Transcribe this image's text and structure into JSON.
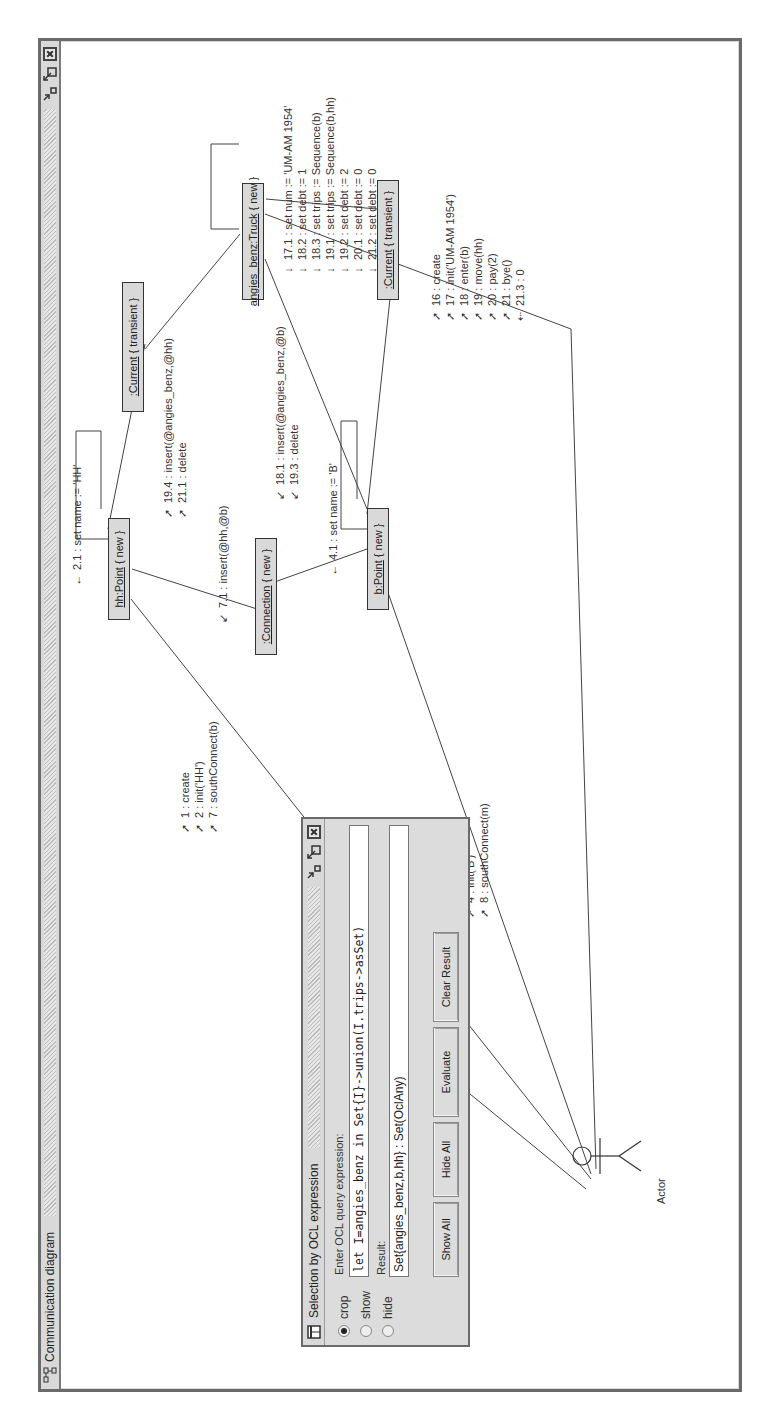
{
  "window": {
    "title": "Communication diagram",
    "controls": [
      "minimize-icon",
      "maximize-icon",
      "close-icon"
    ]
  },
  "diagram": {
    "objects": [
      {
        "id": "hh",
        "name": "hh:Point",
        "state": "{ new }"
      },
      {
        "id": "connection",
        "name": ":Connection",
        "state": "{ new }"
      },
      {
        "id": "b",
        "name": "b:Point",
        "state": "{ new }"
      },
      {
        "id": "current1",
        "name": ":Current",
        "state": "{ transient }"
      },
      {
        "id": "truck",
        "name": "angies_benz:Truck",
        "state": "{ new }"
      },
      {
        "id": "current2",
        "name": ":Current",
        "state": "{ transient }"
      }
    ],
    "actor": {
      "label": "Actor"
    },
    "messages": {
      "actor_hh": [
        "1 : create",
        "2 : init('HH')",
        "7 : southConnect(b)"
      ],
      "actor_b": [
        "3 : create",
        "4 : init('B')",
        "8 : southConnect(m)"
      ],
      "actor_truck": [
        "16 : create",
        "17 : init('UM-AM 1954')",
        "18 : enter(b)",
        "19 : move(hh)",
        "20 : pay(2)",
        "21 : bye()",
        "21.3 : 0"
      ],
      "hh_self": [
        "2.1 : set name := 'HH'"
      ],
      "b_self": [
        "4.1 : set name := 'B'"
      ],
      "hh_connection": [
        "7.1 : insert(@hh,@b)"
      ],
      "hh_current": [
        "19.4 : insert(@angies_benz,@hh)",
        "21.1 : delete"
      ],
      "b_current": [
        "18.1 : insert(@angies_benz,@b)",
        "19.3 : delete"
      ],
      "truck_self": [
        "17.1 : set num := 'UM-AM 1954'",
        "18.2 : set debt := 1",
        "18.3 : set trips := Sequence(b)",
        "19.1 : set trips := Sequence(b,hh)",
        "19.2 : set debt := 2",
        "20.1 : set debt := 0",
        "21.2 : set debt := 0"
      ]
    }
  },
  "ocl_dialog": {
    "title": "Selection by OCL expression",
    "modes": [
      {
        "label": "crop",
        "selected": true
      },
      {
        "label": "show",
        "selected": false
      },
      {
        "label": "hide",
        "selected": false
      }
    ],
    "query_label": "Enter OCL query expression:",
    "query_value": "let I=angies_benz in Set{I}->union(I.trips->asSet)",
    "result_label": "Result:",
    "result_value": "Set{angies_benz,b,hh} : Set(OclAny)",
    "buttons": {
      "show_all": "Show All",
      "hide_all": "Hide All",
      "evaluate": "Evaluate",
      "clear_result": "Clear Result"
    }
  },
  "colors": {
    "object_fill": "#d9d9d9",
    "titlebar": "#d9d9d9",
    "border": "#6a6a6a"
  }
}
